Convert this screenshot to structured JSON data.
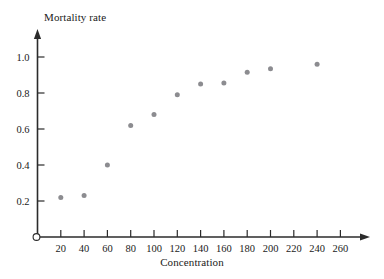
{
  "chart_data": {
    "type": "scatter",
    "title": "",
    "xlabel": "Concentration",
    "ylabel": "Mortality rate",
    "xlim": [
      0,
      272
    ],
    "ylim": [
      0,
      1.06
    ],
    "grid": false,
    "legend": null,
    "marker": {
      "shape": "circle",
      "color": "#8c8c90",
      "size_px": 5
    },
    "axis_style": {
      "color": "#2b2b2b",
      "arrow_heads": true,
      "origin_marker": "open-circle"
    },
    "xticks": [
      20,
      40,
      60,
      80,
      100,
      120,
      140,
      160,
      180,
      200,
      220,
      240,
      260
    ],
    "xtick_labels": [
      "20",
      "40",
      "60",
      "80",
      "100",
      "120",
      "140",
      "160",
      "180",
      "200",
      "220",
      "240",
      "260"
    ],
    "yticks": [
      0.2,
      0.4,
      0.6,
      0.8,
      1.0
    ],
    "ytick_labels": [
      "0.2",
      "0.4",
      "0.6",
      "0.8",
      "1.0"
    ],
    "x": [
      20,
      40,
      60,
      80,
      100,
      120,
      140,
      160,
      180,
      200,
      240
    ],
    "values": [
      0.22,
      0.23,
      0.4,
      0.62,
      0.68,
      0.79,
      0.85,
      0.855,
      0.915,
      0.935,
      0.96
    ],
    "points": [
      {
        "x": 20,
        "y": 0.22
      },
      {
        "x": 40,
        "y": 0.23
      },
      {
        "x": 60,
        "y": 0.4
      },
      {
        "x": 80,
        "y": 0.62
      },
      {
        "x": 100,
        "y": 0.68
      },
      {
        "x": 120,
        "y": 0.79
      },
      {
        "x": 140,
        "y": 0.85
      },
      {
        "x": 160,
        "y": 0.855
      },
      {
        "x": 180,
        "y": 0.915
      },
      {
        "x": 200,
        "y": 0.935
      },
      {
        "x": 240,
        "y": 0.96
      }
    ]
  }
}
